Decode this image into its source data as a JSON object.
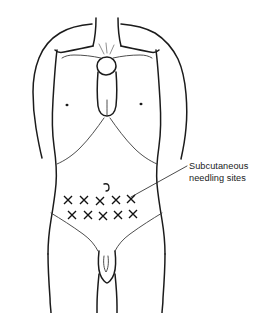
{
  "figure": {
    "background_color": "#ffffff",
    "outline_color": "#1b1b1b",
    "detail_color": "#3a3a3a",
    "mark_color": "#111111",
    "text_color": "#1a1a1a"
  },
  "callout": {
    "line1": "Subcutaneous",
    "line2": "needling sites",
    "full_text": "Subcutaneous needling sites",
    "leader_from_x": 187,
    "leader_from_y": 166,
    "leader_to_x": 131,
    "leader_to_y": 197
  },
  "anatomy": {
    "view": "anterior",
    "subject": "adult male torso",
    "landmarks": [
      {
        "name": "neck",
        "label": "neck"
      },
      {
        "name": "clavicle-left",
        "label": "left clavicle"
      },
      {
        "name": "clavicle-right",
        "label": "right clavicle"
      },
      {
        "name": "sternum",
        "label": "sternum"
      },
      {
        "name": "nipple-left",
        "label": "left nipple"
      },
      {
        "name": "nipple-right",
        "label": "right nipple"
      },
      {
        "name": "costal-margin",
        "label": "costal margin"
      },
      {
        "name": "navel",
        "label": "umbilicus"
      },
      {
        "name": "inguinal-crease-left",
        "label": "left inguinal crease"
      },
      {
        "name": "inguinal-crease-right",
        "label": "right inguinal crease"
      },
      {
        "name": "genitalia",
        "label": "genitalia"
      },
      {
        "name": "arm-left",
        "label": "left arm"
      },
      {
        "name": "arm-right",
        "label": "right arm"
      },
      {
        "name": "thigh-left",
        "label": "left thigh"
      },
      {
        "name": "thigh-right",
        "label": "right thigh"
      }
    ]
  },
  "needling_sites": {
    "marker_glyph": "X",
    "marker_size": 9,
    "rows": 2,
    "per_row": 5,
    "total_count": 10,
    "row1": [
      {
        "index": 1,
        "x": 68,
        "y": 200
      },
      {
        "index": 2,
        "x": 84,
        "y": 200
      },
      {
        "index": 3,
        "x": 100,
        "y": 201
      },
      {
        "index": 4,
        "x": 116,
        "y": 200
      },
      {
        "index": 5,
        "x": 131,
        "y": 199
      }
    ],
    "row2": [
      {
        "index": 6,
        "x": 72,
        "y": 215
      },
      {
        "index": 7,
        "x": 88,
        "y": 215
      },
      {
        "index": 8,
        "x": 103,
        "y": 216
      },
      {
        "index": 9,
        "x": 118,
        "y": 215
      },
      {
        "index": 10,
        "x": 133,
        "y": 214
      }
    ]
  },
  "navel": {
    "x": 106,
    "y": 187
  },
  "nipples": [
    {
      "side": "left",
      "x": 67,
      "y": 105
    },
    {
      "side": "right",
      "x": 141,
      "y": 104
    }
  ]
}
